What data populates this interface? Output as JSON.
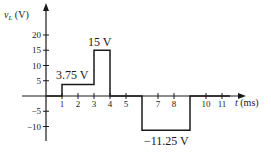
{
  "chart_data": {
    "type": "line",
    "title": "",
    "xlabel": "t (ms)",
    "ylabel": "v_L (V)",
    "xlim": [
      0,
      12
    ],
    "ylim": [
      -12,
      22
    ],
    "x_ticks": [
      1,
      2,
      3,
      4,
      5,
      7,
      8,
      10,
      11
    ],
    "y_ticks": [
      20,
      15,
      10,
      5,
      -5,
      -10
    ],
    "grid": false,
    "legend": null,
    "series": [
      {
        "name": "v_L",
        "points": [
          [
            0,
            0
          ],
          [
            1,
            0
          ],
          [
            1,
            3.75
          ],
          [
            3,
            3.75
          ],
          [
            3,
            15
          ],
          [
            4,
            15
          ],
          [
            4,
            0
          ],
          [
            6,
            0
          ],
          [
            6,
            -11.25
          ],
          [
            9,
            -11.25
          ],
          [
            9,
            0
          ],
          [
            11.5,
            0
          ]
        ]
      }
    ],
    "annotations": [
      {
        "text": "3.75 V",
        "x": 2,
        "y": 3.75
      },
      {
        "text": "15 V",
        "x": 3.5,
        "y": 15
      },
      {
        "text": "−11.25 V",
        "x": 7.5,
        "y": -11.25
      }
    ]
  },
  "axes": {
    "y_label_main": "v",
    "y_label_sub": "L",
    "y_label_unit": " (V)",
    "x_label_var": "t",
    "x_label_unit": " (ms)"
  },
  "ticks": {
    "x": [
      {
        "label": "1",
        "t": 1
      },
      {
        "label": "2",
        "t": 2
      },
      {
        "label": "3",
        "t": 3
      },
      {
        "label": "4",
        "t": 4
      },
      {
        "label": "5",
        "t": 5
      },
      {
        "label": "7",
        "t": 7
      },
      {
        "label": "8",
        "t": 8
      },
      {
        "label": "10",
        "t": 10
      },
      {
        "label": "11",
        "t": 11
      }
    ],
    "y": [
      {
        "label": "20",
        "v": 20
      },
      {
        "label": "15",
        "v": 15
      },
      {
        "label": "10",
        "v": 10
      },
      {
        "label": "5",
        "v": 5
      },
      {
        "label": "−5",
        "v": -5
      },
      {
        "label": "−10",
        "v": -10
      }
    ]
  },
  "labels": {
    "pulse1": "3.75 V",
    "pulse2": "15 V",
    "pulse3": "−11.25 V"
  },
  "colors": {
    "line": "#1a1a1a",
    "background": "#ffffff"
  }
}
